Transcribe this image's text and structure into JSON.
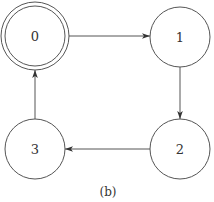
{
  "diagram": {
    "type": "state-machine",
    "caption": "(b)",
    "colors": {
      "stroke": "#555555",
      "text": "#333333",
      "background": "#ffffff"
    },
    "nodes": [
      {
        "id": "0",
        "label": "0",
        "accepting": true,
        "cx": 35,
        "cy": 36
      },
      {
        "id": "1",
        "label": "1",
        "accepting": false,
        "cx": 180,
        "cy": 37
      },
      {
        "id": "2",
        "label": "2",
        "accepting": false,
        "cx": 180,
        "cy": 149
      },
      {
        "id": "3",
        "label": "3",
        "accepting": false,
        "cx": 35,
        "cy": 149
      }
    ],
    "edges": [
      {
        "from": "0",
        "to": "1"
      },
      {
        "from": "1",
        "to": "2"
      },
      {
        "from": "2",
        "to": "3"
      },
      {
        "from": "3",
        "to": "0"
      }
    ]
  }
}
